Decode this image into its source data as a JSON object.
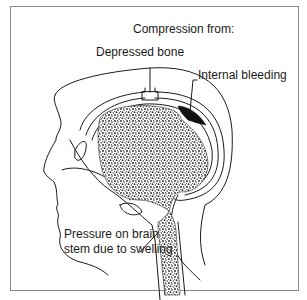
{
  "diagram": {
    "title": "Compression from:",
    "labels": {
      "depressed_bone": "Depressed bone",
      "internal_bleeding": "Internal bleeding",
      "pressure_line1": "Pressure on brain",
      "pressure_line2": "stem due to swelling"
    },
    "colors": {
      "line": "#1a1a1a",
      "frame": "#8a8a8a",
      "bleeding": "#111111",
      "brain_stipple": "#2a2a2a"
    }
  }
}
